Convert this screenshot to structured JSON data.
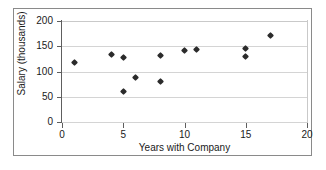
{
  "chart_data": {
    "type": "scatter",
    "title": "",
    "xlabel": "Years with Company",
    "ylabel": "Salary (thousands)",
    "xlim": [
      0,
      20
    ],
    "ylim": [
      0,
      200
    ],
    "xticks": [
      0,
      5,
      10,
      15,
      20
    ],
    "yticks": [
      0,
      50,
      100,
      150,
      200
    ],
    "xtick_labels": [
      "0",
      "5",
      "10",
      "15",
      "20"
    ],
    "ytick_labels": [
      "0",
      "50",
      "100",
      "150",
      "200"
    ],
    "grid": "horizontal",
    "legend": "none",
    "marker": "diamond",
    "marker_color": "#2b2b2b",
    "points": [
      {
        "x": 1,
        "y": 118
      },
      {
        "x": 4,
        "y": 134
      },
      {
        "x": 5,
        "y": 127
      },
      {
        "x": 5,
        "y": 60
      },
      {
        "x": 6,
        "y": 88
      },
      {
        "x": 8,
        "y": 131
      },
      {
        "x": 8,
        "y": 80
      },
      {
        "x": 10,
        "y": 141
      },
      {
        "x": 11,
        "y": 144
      },
      {
        "x": 15,
        "y": 145
      },
      {
        "x": 15,
        "y": 129
      },
      {
        "x": 17,
        "y": 172
      }
    ]
  },
  "colors": {
    "axis": "#5e5e5e",
    "grid": "#d4d4d4",
    "frame": "#8a8a8a",
    "text": "#1a1a1a",
    "marker": "#2b2b2b",
    "background": "#ffffff"
  }
}
